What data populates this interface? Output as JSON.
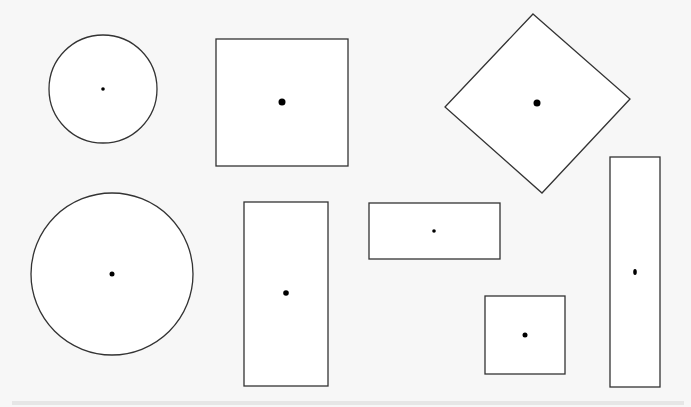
{
  "diagram": {
    "background": "#f7f7f7",
    "stroke": "#333333",
    "fill": "#ffffff",
    "shapes": [
      {
        "id": "circle-small",
        "type": "circle",
        "cx": 103,
        "cy": 89,
        "r": 54,
        "dot_r": 1.8
      },
      {
        "id": "square-top",
        "type": "rect",
        "x": 216,
        "y": 39,
        "w": 132,
        "h": 127,
        "dot": [
          282,
          102
        ],
        "dot_r": 3.5
      },
      {
        "id": "diamond",
        "type": "polygon",
        "points": "533,14 630,99 542,193 445,107",
        "dot": [
          537,
          103
        ],
        "dot_r": 3.5
      },
      {
        "id": "circle-large",
        "type": "circle",
        "cx": 112,
        "cy": 274,
        "r": 81,
        "dot_r": 2.5
      },
      {
        "id": "rect-tall",
        "type": "rect",
        "x": 244,
        "y": 202,
        "w": 84,
        "h": 184,
        "dot": [
          286,
          293
        ],
        "dot_r": 2.8
      },
      {
        "id": "rect-wide",
        "type": "rect",
        "x": 369,
        "y": 203,
        "w": 131,
        "h": 56,
        "dot": [
          434,
          231
        ],
        "dot_r": 1.8
      },
      {
        "id": "square-small",
        "type": "rect",
        "x": 485,
        "y": 296,
        "w": 80,
        "h": 78,
        "dot": [
          525,
          335
        ],
        "dot_r": 2.5
      },
      {
        "id": "rect-narrow-tall",
        "type": "rect",
        "x": 610,
        "y": 157,
        "w": 50,
        "h": 230,
        "dot": [
          635,
          272
        ],
        "dot_rx": 1.8,
        "dot_ry": 3
      }
    ]
  }
}
